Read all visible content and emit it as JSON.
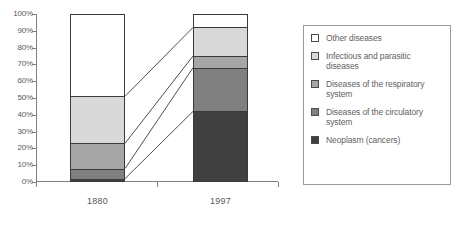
{
  "chart_data": {
    "type": "bar",
    "stacked": true,
    "normalized_percent": true,
    "title": "",
    "subtitle": "",
    "xlabel": "",
    "ylabel": "",
    "categories": [
      "1880",
      "1997"
    ],
    "ylim": [
      0,
      100
    ],
    "ytick_labels": [
      "0%",
      "10%",
      "20%",
      "30%",
      "40%",
      "50%",
      "60%",
      "70%",
      "80%",
      "90%",
      "100%"
    ],
    "ytick_values": [
      0,
      10,
      20,
      30,
      40,
      50,
      60,
      70,
      80,
      90,
      100
    ],
    "grid": false,
    "legend_position": "right",
    "series": [
      {
        "name": "Other diseases",
        "color": "#ffffff",
        "values": [
          49,
          8
        ],
        "cumulative_top": [
          100,
          100
        ]
      },
      {
        "name": "Infectious and parasitic diseases",
        "color": "#d9d9d9",
        "values": [
          28,
          17
        ],
        "cumulative_top": [
          51,
          92
        ]
      },
      {
        "name": "Diseases of the respiratory system",
        "color": "#a6a6a6",
        "values": [
          15,
          7
        ],
        "cumulative_top": [
          23,
          75
        ]
      },
      {
        "name": "Diseases of the circulatory system",
        "color": "#808080",
        "values": [
          6,
          26
        ],
        "cumulative_top": [
          8,
          68
        ]
      },
      {
        "name": "Neoplasm (cancers)",
        "color": "#404040",
        "values": [
          2,
          42
        ],
        "cumulative_top": [
          2,
          42
        ]
      }
    ],
    "connector_lines": [
      {
        "from_percent": 51,
        "to_percent": 92
      },
      {
        "from_percent": 23,
        "to_percent": 75
      },
      {
        "from_percent": 8,
        "to_percent": 68
      },
      {
        "from_percent": 2,
        "to_percent": 42
      }
    ]
  },
  "legend": {
    "items": [
      {
        "label": "Other diseases",
        "color": "#ffffff"
      },
      {
        "label": "Infectious and parasitic diseases",
        "color": "#d9d9d9"
      },
      {
        "label": "Diseases of the respiratory system",
        "color": "#a6a6a6"
      },
      {
        "label": "Diseases of the circulatory system",
        "color": "#808080"
      },
      {
        "label": "Neoplasm (cancers)",
        "color": "#404040"
      }
    ]
  }
}
